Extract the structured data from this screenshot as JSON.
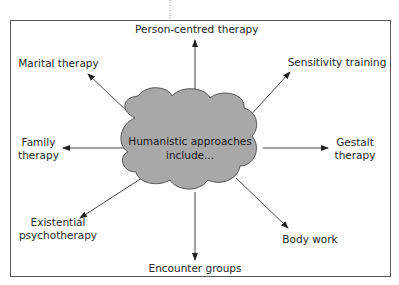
{
  "diagram": {
    "center": {
      "line1": "Humanistic approaches",
      "line2": "include..."
    },
    "nodes": [
      {
        "id": "person-centred",
        "label": "Person-centred therapy"
      },
      {
        "id": "sensitivity",
        "label": "Sensitivity training"
      },
      {
        "id": "gestalt",
        "line1": "Gestalt",
        "line2": "therapy"
      },
      {
        "id": "body-work",
        "label": "Body work"
      },
      {
        "id": "encounter",
        "label": "Encounter groups"
      },
      {
        "id": "existential",
        "line1": "Existential",
        "line2": "psychotherapy"
      },
      {
        "id": "family",
        "line1": "Family",
        "line2": "therapy"
      },
      {
        "id": "marital",
        "label": "Marital therapy"
      }
    ],
    "colors": {
      "cloud_fill": "#a8a8a8",
      "cloud_stroke": "#555555",
      "frame": "#555555",
      "arrow": "#333333"
    }
  }
}
